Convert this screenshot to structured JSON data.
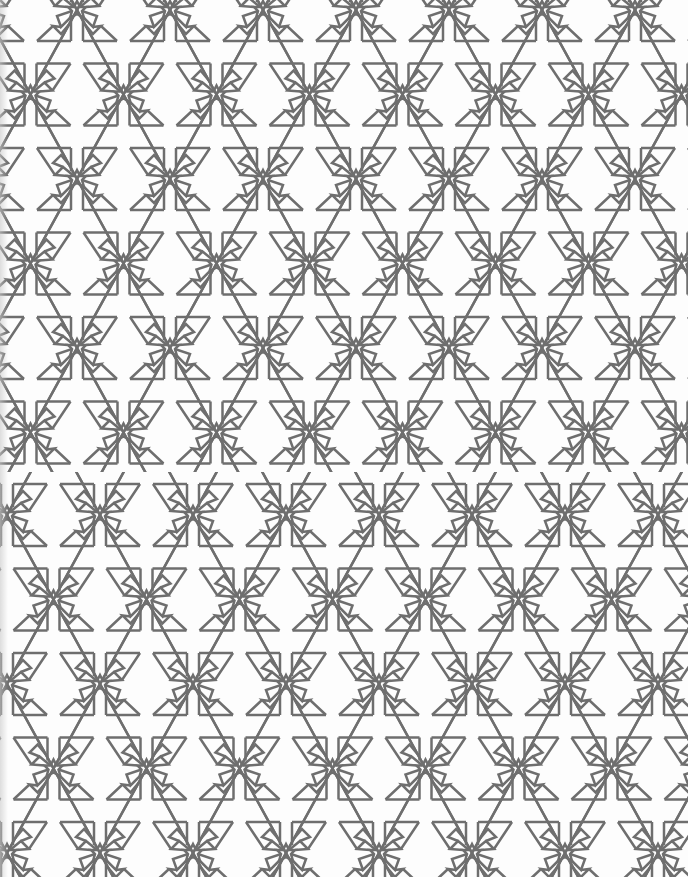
{
  "image": {
    "description": "Geometric Islamic-style tessellation of eight-point star rosettes, petal kites, rectangular frames and interlaced triangular lattice lines, drawn in grey on white",
    "background_color": "#fdfdfd",
    "line_color": "#6e6e6e",
    "line_width": 2.5
  },
  "pattern": {
    "motif": "eight-point-star-rosette",
    "period_x": 93,
    "row_spacing_y": 84.5,
    "sections": [
      {
        "name": "upper",
        "top": 0,
        "height": 472,
        "first_row_y": 10,
        "row_a_star_x": 77,
        "row_b_star_x": 30.5
      },
      {
        "name": "lower",
        "top": 472,
        "height": 405,
        "first_row_y": 43,
        "row_a_star_x": 7,
        "row_b_star_x": 53.5
      }
    ]
  }
}
